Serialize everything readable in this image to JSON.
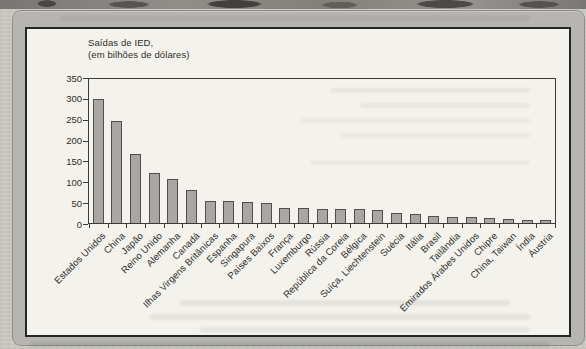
{
  "figure": {
    "title_line1": "Saídas de IED,",
    "title_line2": "(em bilhões de dólares)"
  },
  "chart_data": {
    "type": "bar",
    "title": "Saídas de IED, (em bilhões de dólares)",
    "categories": [
      "Estados Unidos",
      "China",
      "Japão",
      "Reino Unido",
      "Alemanha",
      "Canadá",
      "Ilhas Virgens Britânicas",
      "Espanha",
      "Singapura",
      "Países Baixos",
      "França",
      "Luxemburgo",
      "Rússia",
      "República da Coreia",
      "Bélgica",
      "Suíça, Liechtenstein",
      "Suécia",
      "Itália",
      "Brasil",
      "Tailândia",
      "Emirados Árabes Unidos",
      "Chipre",
      "China, Taiwan",
      "Índia",
      "Áustria"
    ],
    "values": [
      300,
      245,
      165,
      118,
      105,
      78,
      52,
      52,
      48,
      45,
      35,
      33,
      32,
      31,
      31,
      28,
      23,
      20,
      15,
      13,
      11,
      10,
      8,
      6,
      5
    ],
    "xlabel": "",
    "ylabel": "",
    "ylim": [
      0,
      350
    ],
    "yticks": [
      0,
      50,
      100,
      150,
      200,
      250,
      300,
      350
    ],
    "grid": false,
    "legend": null,
    "bar_color": "#a8a7a3",
    "bar_border_color": "#504f4b",
    "axis_color": "#3c3b38",
    "text_color": "#2f2e2b",
    "plot_background": "#f3f2ec"
  }
}
